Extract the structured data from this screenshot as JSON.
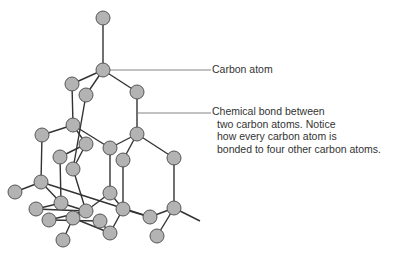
{
  "diagram": {
    "colors": {
      "atom_fill": "#b3b3b3",
      "atom_stroke": "#555555",
      "bond": "#333333",
      "leader": "#666666",
      "text": "#333333"
    },
    "atom_radius": 7,
    "atoms": [
      [
        103,
        18
      ],
      [
        103,
        70
      ],
      [
        72,
        84
      ],
      [
        86,
        95
      ],
      [
        137,
        92
      ],
      [
        73,
        125
      ],
      [
        42,
        135
      ],
      [
        86,
        144
      ],
      [
        110,
        148
      ],
      [
        137,
        134
      ],
      [
        60,
        157
      ],
      [
        73,
        169
      ],
      [
        174,
        158
      ],
      [
        123,
        160
      ],
      [
        41,
        182
      ],
      [
        15,
        192
      ],
      [
        61,
        203
      ],
      [
        110,
        193
      ],
      [
        36,
        209
      ],
      [
        86,
        211
      ],
      [
        123,
        209
      ],
      [
        150,
        217
      ],
      [
        174,
        208
      ],
      [
        49,
        220
      ],
      [
        73,
        218
      ],
      [
        100,
        221
      ],
      [
        110,
        233
      ],
      [
        157,
        236
      ],
      [
        63,
        240
      ]
    ],
    "bonds": [
      [
        0,
        1
      ],
      [
        1,
        2
      ],
      [
        1,
        3
      ],
      [
        1,
        4
      ],
      [
        2,
        5
      ],
      [
        3,
        11
      ],
      [
        4,
        9
      ],
      [
        5,
        6
      ],
      [
        5,
        7
      ],
      [
        5,
        8
      ],
      [
        9,
        8
      ],
      [
        9,
        12
      ],
      [
        9,
        13
      ],
      [
        6,
        14
      ],
      [
        7,
        10
      ],
      [
        7,
        11
      ],
      [
        10,
        16
      ],
      [
        11,
        19
      ],
      [
        8,
        17
      ],
      [
        13,
        20
      ],
      [
        12,
        22
      ],
      [
        14,
        15
      ],
      [
        14,
        16
      ],
      [
        14,
        21
      ],
      [
        16,
        18
      ],
      [
        16,
        19
      ],
      [
        17,
        19
      ],
      [
        17,
        20
      ],
      [
        20,
        21
      ],
      [
        20,
        26
      ],
      [
        21,
        22
      ],
      [
        22,
        27
      ],
      [
        22,
        "E"
      ],
      [
        18,
        19
      ],
      [
        19,
        23
      ],
      [
        19,
        24
      ],
      [
        24,
        28
      ],
      [
        23,
        25
      ],
      [
        25,
        26
      ],
      [
        24,
        26
      ]
    ],
    "bond_ext": {
      "E": [
        200,
        221
      ]
    }
  },
  "labels": {
    "carbon_atom": "Carbon atom",
    "bond_line1": "Chemical bond between",
    "bond_line2": "two carbon atoms. Notice",
    "bond_line3": "how every carbon atom is",
    "bond_line4": "bonded to four other carbon atoms."
  }
}
